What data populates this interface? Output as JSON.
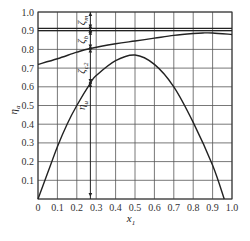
{
  "chart_data": {
    "type": "line",
    "title": "",
    "xlabel": "x1",
    "ylabel": "ηa",
    "xlim": [
      0,
      1.0
    ],
    "ylim": [
      0,
      1.0
    ],
    "grid": true,
    "x_ticks": [
      "0",
      "0.1",
      "0.2",
      "0.3",
      "0.4",
      "0.5",
      "0.6",
      "0.7",
      "0.8",
      "0.9",
      "1.0"
    ],
    "y_ticks": [
      "0.1",
      "0.2",
      "0.3",
      "0.4",
      "0.5",
      "0.6",
      "0.7",
      "0.8",
      "0.9",
      "1.0"
    ],
    "series": [
      {
        "name": "upper efficiency curve",
        "x": [
          0,
          0.1,
          0.2,
          0.27,
          0.4,
          0.5,
          0.6,
          0.7,
          0.8,
          0.85,
          0.9,
          1.0
        ],
        "values": [
          0.72,
          0.75,
          0.785,
          0.805,
          0.83,
          0.845,
          0.86,
          0.875,
          0.885,
          0.888,
          0.888,
          0.88
        ]
      },
      {
        "name": "ηu",
        "x": [
          0,
          0.05,
          0.1,
          0.15,
          0.2,
          0.27,
          0.3,
          0.4,
          0.5,
          0.6,
          0.7,
          0.8,
          0.9,
          0.96
        ],
        "values": [
          0,
          0.14,
          0.28,
          0.4,
          0.5,
          0.62,
          0.66,
          0.74,
          0.77,
          0.72,
          0.6,
          0.41,
          0.18,
          0
        ]
      },
      {
        "name": "horizontal line 1",
        "x": [
          0,
          1.0
        ],
        "values": [
          0.912,
          0.912
        ]
      },
      {
        "name": "horizontal line 2",
        "x": [
          0,
          1.0
        ],
        "values": [
          0.9,
          0.9
        ]
      }
    ],
    "annotations": [
      {
        "text": "ζm",
        "x": 0.27,
        "y_range": [
          0.91,
          1.0
        ]
      },
      {
        "text": "ζb",
        "x": 0.27,
        "y_range": [
          0.805,
          0.9
        ]
      },
      {
        "text": "ζc2",
        "x": 0.27,
        "y_range": [
          0.62,
          0.805
        ]
      },
      {
        "text": "ηu",
        "x": 0.27,
        "y_range": [
          0,
          0.62
        ]
      }
    ],
    "marker_line_x": 0.27
  },
  "labels": {
    "xlabel_main": "x",
    "xlabel_sub": "1",
    "ylabel_main": "η",
    "ylabel_sub": "a",
    "zeta_m": "ζ",
    "zeta_m_sub": "m",
    "zeta_b": "ζ",
    "zeta_b_sub": "b",
    "zeta_c2": "ζ",
    "zeta_c2_sub": "c2",
    "eta_u": "η",
    "eta_u_sub": "u"
  }
}
